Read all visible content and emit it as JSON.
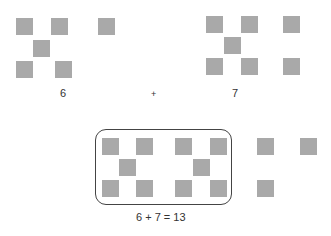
{
  "diagram": {
    "left_group": {
      "label": "6",
      "squares": [
        [
          16,
          18
        ],
        [
          51,
          18
        ],
        [
          98,
          18
        ],
        [
          33,
          40
        ],
        [
          16,
          61
        ],
        [
          55,
          61
        ]
      ]
    },
    "operator": "+",
    "right_group": {
      "label": "7",
      "squares": [
        [
          206,
          16
        ],
        [
          241,
          16
        ],
        [
          283,
          16
        ],
        [
          224,
          37
        ],
        [
          206,
          58
        ],
        [
          241,
          58
        ],
        [
          283,
          58
        ]
      ]
    },
    "result": {
      "equation": "6 + 7 = 13",
      "boxed_squares": [
        [
          102,
          138
        ],
        [
          136,
          138
        ],
        [
          175,
          138
        ],
        [
          210,
          138
        ],
        [
          119,
          159
        ],
        [
          193,
          159
        ],
        [
          102,
          180
        ],
        [
          136,
          180
        ],
        [
          175,
          180
        ],
        [
          210,
          180
        ]
      ],
      "outside_squares": [
        [
          257,
          138
        ],
        [
          300,
          138
        ],
        [
          257,
          180
        ]
      ]
    },
    "colors": {
      "square": "#a9a9a9",
      "box_border": "#444444",
      "text": "#333333"
    }
  }
}
